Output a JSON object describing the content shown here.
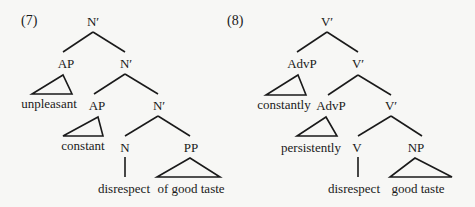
{
  "diagrams": [
    {
      "number": "(7)",
      "nodes": {
        "root": "N′",
        "ap1": "AP",
        "nbar1": "N′",
        "ap1_leaf": "unpleasant",
        "ap2": "AP",
        "nbar2": "N′",
        "ap2_leaf": "constant",
        "head": "N",
        "head_leaf": "disrespect",
        "comp": "PP",
        "comp_leaf": "of good taste"
      }
    },
    {
      "number": "(8)",
      "nodes": {
        "root": "V′",
        "ap1": "AdvP",
        "nbar1": "V′",
        "ap1_leaf": "constantly",
        "ap2": "AdvP",
        "nbar2": "V′",
        "ap2_leaf": "persistently",
        "head": "V",
        "head_leaf": "disrespect",
        "comp": "NP",
        "comp_leaf": "good taste"
      }
    }
  ]
}
